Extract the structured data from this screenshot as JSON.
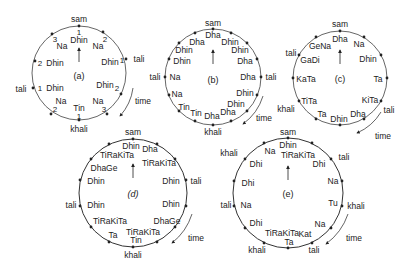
{
  "colors": {
    "ink": "#222222",
    "ring": "#555555",
    "background": "#ffffff"
  },
  "diagrams": [
    {
      "id": "a",
      "caption": "(a)",
      "cx": 79,
      "cy": 73,
      "r": 47,
      "beats": [
        {
          "angle": 0,
          "inner": "Dhin",
          "num": "1"
        },
        {
          "angle": 30,
          "inner": "Na",
          "num": "2"
        },
        {
          "angle": 90,
          "inner": "Dhin",
          "num": "1"
        },
        {
          "angle": 150,
          "inner": "Dhin",
          "num": "2"
        },
        {
          "angle": 180,
          "inner": "Na",
          "num": "3"
        },
        {
          "angle": 180,
          "inner": "Tin",
          "num": "1"
        },
        {
          "angle": 210,
          "inner": "Na",
          "num": "2"
        },
        {
          "angle": 270,
          "inner": "Dhin",
          "num": "1"
        },
        {
          "angle": 300,
          "inner": "Dhin",
          "num": "2"
        },
        {
          "angle": 330,
          "inner": "Na",
          "num": "3"
        }
      ],
      "outer_labels": [
        {
          "text": "sam",
          "x": 79,
          "y": 21
        },
        {
          "text": "tali",
          "x": 139,
          "y": 59
        },
        {
          "text": "tali",
          "x": 20,
          "y": 95
        },
        {
          "text": "khali",
          "x": 79,
          "y": 133
        },
        {
          "text": "time",
          "x": 140,
          "y": 101
        }
      ]
    },
    {
      "id": "b",
      "caption": "(b)",
      "cx": 213,
      "cy": 77,
      "r": 48,
      "beats": [
        "Dha",
        "Dhin",
        "Dhin",
        "Dha",
        "Dha",
        "Dhin",
        "Dhin",
        "Dha",
        "Dha",
        "Tin",
        "Tin",
        "Na",
        "Na",
        "Dhin",
        "Dhin",
        "Dha"
      ],
      "outer_labels": [
        {
          "text": "sam",
          "x": 213,
          "y": 24
        },
        {
          "text": "tali",
          "x": 271,
          "y": 80
        },
        {
          "text": "tali",
          "x": 152,
          "y": 80
        },
        {
          "text": "khali",
          "x": 213,
          "y": 134
        },
        {
          "text": "time",
          "x": 260,
          "y": 120
        }
      ]
    },
    {
      "id": "c",
      "caption": "(c)",
      "cx": 340,
      "cy": 78,
      "r": 47,
      "beats": [
        "Dha",
        "Na",
        "Dhin",
        "Ta",
        "KiTa",
        "Dha",
        "Dhin",
        "Ta",
        "TiTa",
        "KaTa",
        "GaDi",
        "GeNa"
      ],
      "outer_labels": [
        {
          "text": "sam",
          "x": 340,
          "y": 26
        },
        {
          "text": "tali",
          "x": 291,
          "y": 54
        },
        {
          "text": "tali",
          "x": 388,
          "y": 113
        },
        {
          "text": "khali",
          "x": 286,
          "y": 112
        },
        {
          "text": "time",
          "x": 383,
          "y": 136
        }
      ]
    },
    {
      "id": "d",
      "caption": "(d)",
      "cx": 133,
      "cy": 193,
      "r": 54,
      "beats": [
        "Dhin",
        "Dha",
        "TiRaKiTa",
        "Dhin",
        "Dhin",
        "DhaGe",
        "TiRaKiTa",
        "Tin",
        "Ta",
        "TiRaKiTa",
        "Dhin",
        "Dhin",
        "DhaGe",
        "TiRaKiTa"
      ],
      "outer_labels": [
        {
          "text": "sam",
          "x": 133,
          "y": 133
        },
        {
          "text": "tali",
          "x": 196,
          "y": 182
        },
        {
          "text": "tali",
          "x": 69,
          "y": 206
        },
        {
          "text": "khali",
          "x": 133,
          "y": 258
        },
        {
          "text": "time",
          "x": 193,
          "y": 241
        }
      ]
    },
    {
      "id": "e",
      "caption": "(e)",
      "cx": 288,
      "cy": 193,
      "r": 55,
      "beats": [
        "Dhin",
        "TiRaKiTa",
        "Dhi",
        "Na",
        "Tu",
        "Na",
        "Kat",
        "Ta",
        "TiRaKiTa",
        "Dhi",
        "Na",
        "Dhi",
        "Dhi",
        "Na"
      ],
      "outer_labels": [
        {
          "text": "sam",
          "x": 288,
          "y": 133
        },
        {
          "text": "tali",
          "x": 344,
          "y": 158
        },
        {
          "text": "khali",
          "x": 228,
          "y": 156
        },
        {
          "text": "khali",
          "x": 355,
          "y": 208
        },
        {
          "text": "tali",
          "x": 228,
          "y": 207
        },
        {
          "text": "khali",
          "x": 257,
          "y": 253
        },
        {
          "text": "tali",
          "x": 318,
          "y": 253
        },
        {
          "text": "time",
          "x": 353,
          "y": 241
        }
      ]
    }
  ]
}
